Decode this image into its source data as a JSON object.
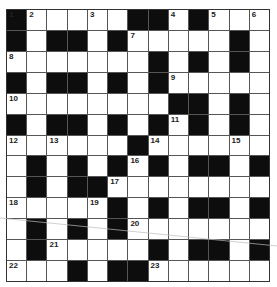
{
  "puzzle": {
    "rows": 13,
    "cols": 13,
    "colors": {
      "block": "#0d0d0d",
      "cell": "#ffffff",
      "grid_line": "#555555"
    },
    "layout": [
      "#.....##.#...",
      "#.##.#.....#.",
      ".......#.#.#.",
      "#.##.#.#.....",
      "........##.#.",
      "#.##.#.#.#.#.",
      "......#......",
      ".#.#.#.#.##.#",
      ".#.##........",
      ".....#.#.##.#",
      ".#.#.#.......",
      ".#.....#.##.#",
      "...#.##......"
    ],
    "numbers": [
      {
        "r": 0,
        "c": 0,
        "n": "1"
      },
      {
        "r": 0,
        "c": 1,
        "n": "2"
      },
      {
        "r": 0,
        "c": 4,
        "n": "3"
      },
      {
        "r": 0,
        "c": 8,
        "n": "4"
      },
      {
        "r": 0,
        "c": 10,
        "n": "5"
      },
      {
        "r": 0,
        "c": 12,
        "n": "6"
      },
      {
        "r": 1,
        "c": 6,
        "n": "7"
      },
      {
        "r": 2,
        "c": 0,
        "n": "8"
      },
      {
        "r": 3,
        "c": 8,
        "n": "9"
      },
      {
        "r": 4,
        "c": 0,
        "n": "10"
      },
      {
        "r": 5,
        "c": 8,
        "n": "11"
      },
      {
        "r": 6,
        "c": 0,
        "n": "12"
      },
      {
        "r": 6,
        "c": 2,
        "n": "13"
      },
      {
        "r": 6,
        "c": 7,
        "n": "14"
      },
      {
        "r": 6,
        "c": 11,
        "n": "15"
      },
      {
        "r": 7,
        "c": 6,
        "n": "16"
      },
      {
        "r": 8,
        "c": 5,
        "n": "17"
      },
      {
        "r": 9,
        "c": 0,
        "n": "18"
      },
      {
        "r": 9,
        "c": 4,
        "n": "19"
      },
      {
        "r": 10,
        "c": 6,
        "n": "20"
      },
      {
        "r": 11,
        "c": 2,
        "n": "21"
      },
      {
        "r": 12,
        "c": 0,
        "n": "22"
      },
      {
        "r": 12,
        "c": 7,
        "n": "23"
      }
    ]
  }
}
